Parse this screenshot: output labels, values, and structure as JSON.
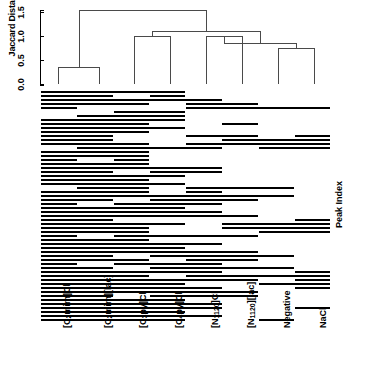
{
  "figure": {
    "y_axis_label": "Jaccard Distance",
    "right_axis_label": "Peak Index"
  },
  "chart_data": {
    "type": "heatmap",
    "title": "",
    "xlabel": "",
    "ylabel": "Jaccard Distance",
    "right_label": "Peak Index",
    "grid": false,
    "legend": "none",
    "dendrogram": {
      "ylim": [
        0.0,
        1.6
      ],
      "yticks": [
        0.0,
        0.5,
        1.0,
        1.5
      ],
      "ytick_labels": [
        "0.0",
        "0.5",
        "1.0",
        "1.5"
      ],
      "distance_metric": "Jaccard Distance",
      "leaf_order": [
        "[C2mim]Cl",
        "[C2mim][lac]",
        "[C3py]Cl",
        "[C4py]Cl",
        "[N1120]Cl",
        "[N1120][lac]",
        "Negative",
        "NaCl"
      ],
      "merges": [
        {
          "left": "[C2mim]Cl",
          "right": "[C2mim][lac]",
          "height": 0.36
        },
        {
          "left": "[C3py]Cl",
          "right": "[C4py]Cl",
          "height": 1.01
        },
        {
          "left": "[N1120]Cl",
          "right": "[N1120][lac]",
          "height": 0.99
        },
        {
          "left": "Negative",
          "right": "NaCl",
          "height": 0.74
        },
        {
          "left": "{Negative,NaCl}",
          "right": "{N1120 pair}",
          "height": 0.86
        },
        {
          "left": "{C3py,C4py}",
          "right": "{N1120,Negative,NaCl}",
          "height": 1.1
        },
        {
          "left": "{C2mim pair}",
          "right": "{rest}",
          "height": 1.55
        }
      ]
    },
    "categories": [
      "[C2mim]Cl",
      "[C2mim][lac]",
      "[C3py]Cl",
      "[C4py]Cl",
      "[N1120]Cl",
      "[N1120][lac]",
      "Negative",
      "NaCl"
    ],
    "value_encoding": {
      "0": "absent (white)",
      "1": "present (black bar)"
    },
    "n_peaks": 58,
    "matrix": [
      [
        1,
        1,
        1,
        1,
        0,
        0,
        0,
        0
      ],
      [
        1,
        1,
        0,
        1,
        0,
        0,
        0,
        0
      ],
      [
        1,
        1,
        1,
        1,
        1,
        0,
        0,
        0
      ],
      [
        1,
        1,
        1,
        0,
        1,
        1,
        0,
        0
      ],
      [
        1,
        0,
        0,
        0,
        1,
        1,
        1,
        1
      ],
      [
        0,
        0,
        1,
        1,
        0,
        0,
        0,
        0
      ],
      [
        0,
        1,
        1,
        1,
        0,
        0,
        0,
        0
      ],
      [
        1,
        1,
        1,
        1,
        0,
        0,
        0,
        0
      ],
      [
        1,
        1,
        1,
        0,
        0,
        1,
        0,
        0
      ],
      [
        1,
        1,
        1,
        1,
        0,
        0,
        0,
        0
      ],
      [
        1,
        1,
        1,
        0,
        0,
        0,
        0,
        0
      ],
      [
        1,
        1,
        0,
        0,
        1,
        1,
        0,
        1
      ],
      [
        1,
        1,
        0,
        0,
        0,
        1,
        1,
        1
      ],
      [
        1,
        1,
        1,
        0,
        1,
        1,
        1,
        1
      ],
      [
        0,
        1,
        1,
        1,
        1,
        0,
        1,
        1
      ],
      [
        1,
        1,
        1,
        0,
        0,
        0,
        0,
        0
      ],
      [
        1,
        1,
        1,
        0,
        0,
        0,
        0,
        0
      ],
      [
        1,
        0,
        1,
        0,
        0,
        0,
        0,
        0
      ],
      [
        1,
        1,
        1,
        0,
        0,
        0,
        0,
        0
      ],
      [
        1,
        1,
        1,
        1,
        1,
        0,
        0,
        0
      ],
      [
        1,
        1,
        0,
        1,
        1,
        0,
        0,
        0
      ],
      [
        1,
        1,
        1,
        1,
        0,
        0,
        0,
        0
      ],
      [
        1,
        1,
        1,
        0,
        0,
        0,
        0,
        0
      ],
      [
        1,
        1,
        1,
        1,
        0,
        0,
        0,
        0
      ],
      [
        0,
        1,
        1,
        0,
        1,
        1,
        1,
        0
      ],
      [
        1,
        1,
        1,
        0,
        1,
        0,
        0,
        0
      ],
      [
        1,
        1,
        1,
        1,
        1,
        1,
        1,
        0
      ],
      [
        1,
        1,
        0,
        1,
        1,
        1,
        0,
        0
      ],
      [
        1,
        0,
        1,
        1,
        1,
        0,
        0,
        0
      ],
      [
        1,
        1,
        1,
        1,
        0,
        0,
        0,
        0
      ],
      [
        1,
        1,
        1,
        1,
        1,
        0,
        0,
        0
      ],
      [
        1,
        1,
        1,
        1,
        1,
        1,
        0,
        0
      ],
      [
        1,
        1,
        0,
        0,
        0,
        0,
        0,
        1
      ],
      [
        1,
        1,
        1,
        1,
        0,
        1,
        1,
        1
      ],
      [
        1,
        1,
        1,
        0,
        0,
        1,
        1,
        1
      ],
      [
        1,
        1,
        1,
        0,
        0,
        0,
        1,
        1
      ],
      [
        1,
        0,
        1,
        1,
        1,
        1,
        0,
        0
      ],
      [
        1,
        1,
        1,
        0,
        0,
        0,
        0,
        0
      ],
      [
        1,
        1,
        1,
        1,
        1,
        0,
        0,
        0
      ],
      [
        1,
        1,
        1,
        1,
        0,
        0,
        0,
        0
      ],
      [
        1,
        1,
        1,
        1,
        1,
        1,
        0,
        0
      ],
      [
        1,
        1,
        0,
        1,
        1,
        1,
        1,
        0
      ],
      [
        1,
        1,
        1,
        0,
        1,
        1,
        0,
        0
      ],
      [
        1,
        0,
        1,
        1,
        1,
        0,
        0,
        0
      ],
      [
        1,
        1,
        0,
        1,
        1,
        1,
        1,
        0
      ],
      [
        1,
        1,
        1,
        1,
        1,
        0,
        0,
        1
      ],
      [
        1,
        1,
        1,
        0,
        1,
        1,
        1,
        1
      ],
      [
        1,
        1,
        1,
        1,
        1,
        1,
        0,
        1
      ],
      [
        1,
        1,
        1,
        1,
        0,
        0,
        1,
        1
      ],
      [
        1,
        1,
        1,
        1,
        1,
        0,
        0,
        1
      ],
      [
        1,
        1,
        1,
        1,
        1,
        1,
        0,
        0
      ],
      [
        1,
        1,
        0,
        1,
        1,
        1,
        0,
        0
      ],
      [
        1,
        1,
        1,
        1,
        0,
        0,
        0,
        0
      ],
      [
        1,
        1,
        1,
        1,
        1,
        0,
        0,
        0
      ],
      [
        1,
        1,
        1,
        1,
        1,
        0,
        0,
        1
      ],
      [
        1,
        1,
        1,
        1,
        0,
        0,
        0,
        0
      ],
      [
        1,
        1,
        1,
        1,
        1,
        0,
        0,
        0
      ],
      [
        1,
        1,
        1,
        1,
        0,
        0,
        1,
        0
      ]
    ]
  },
  "axis": {
    "yticks": [
      {
        "label": "0.0",
        "value": 0.0
      },
      {
        "label": "0.5",
        "value": 0.5
      },
      {
        "label": "1.0",
        "value": 1.0
      },
      {
        "label": "1.5",
        "value": 1.5
      }
    ]
  },
  "xlabels": [
    {
      "text": "[C2mim]Cl",
      "main": "[C",
      "sub": "2",
      "rest": "mim]Cl"
    },
    {
      "text": "[C2mim][lac]",
      "main": "[C",
      "sub": "2",
      "rest": "mim][lac]"
    },
    {
      "text": "[C3py]Cl",
      "main": "[C",
      "sub": "3",
      "rest": "py]Cl"
    },
    {
      "text": "[C4py]Cl",
      "main": "[C",
      "sub": "4",
      "rest": "py]Cl"
    },
    {
      "text": "[N1120]Cl",
      "main": "[N",
      "sub": "1120",
      "rest": "]Cl"
    },
    {
      "text": "[N1120][lac]",
      "main": "[N",
      "sub": "1120",
      "rest": "][lac]"
    },
    {
      "text": "Negative",
      "main": "Negative",
      "sub": "",
      "rest": ""
    },
    {
      "text": "NaCl",
      "main": "NaCl",
      "sub": "",
      "rest": ""
    }
  ]
}
